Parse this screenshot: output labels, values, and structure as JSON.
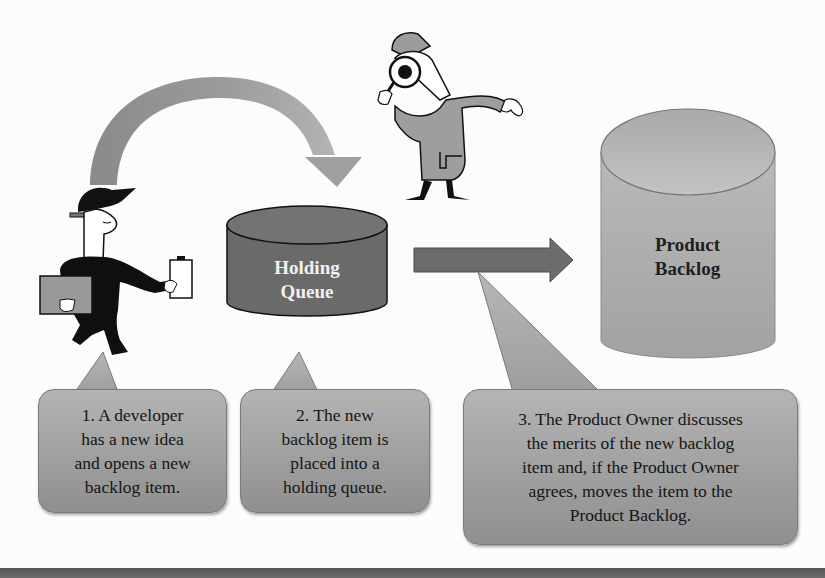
{
  "diagram": {
    "holding_queue": {
      "label_line1": "Holding",
      "label_line2": "Queue",
      "fill": "#6b6b6b"
    },
    "product_backlog": {
      "label_line1": "Product",
      "label_line2": "Backlog",
      "fill": "#a9a9a9"
    },
    "arrows": {
      "curved": "developer-to-holding-queue",
      "straight": "holding-queue-to-product-backlog"
    },
    "figures": {
      "developer": "developer-figure",
      "inspector": "product-owner-inspector-figure"
    },
    "callouts": [
      {
        "lines": [
          "1. A developer",
          "has a new idea",
          "and opens a new",
          "backlog item."
        ]
      },
      {
        "lines": [
          "2. The new",
          "backlog item is",
          "placed into a",
          "holding queue."
        ]
      },
      {
        "lines": [
          "3. The Product Owner discusses",
          "the merits of the new backlog",
          "item and, if the Product Owner",
          "agrees, moves the item to the",
          "Product Backlog."
        ]
      }
    ]
  }
}
